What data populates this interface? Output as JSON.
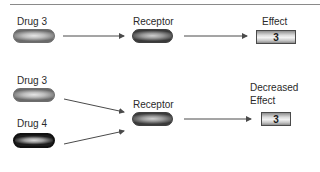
{
  "panel_top": {
    "drug_label": "Drug 3",
    "receptor_label": "Receptor",
    "effect_label": "Effect",
    "effect_value": "3"
  },
  "panel_bottom": {
    "drug_a_label": "Drug 3",
    "drug_b_label": "Drug 4",
    "receptor_label": "Receptor",
    "effect_label_line1": "Decreased",
    "effect_label_line2": "Effect",
    "effect_value": "3"
  },
  "colors": {
    "arrow": "#4a4a4a",
    "rule": "#8a8a8a",
    "text": "#2a2a2a"
  }
}
